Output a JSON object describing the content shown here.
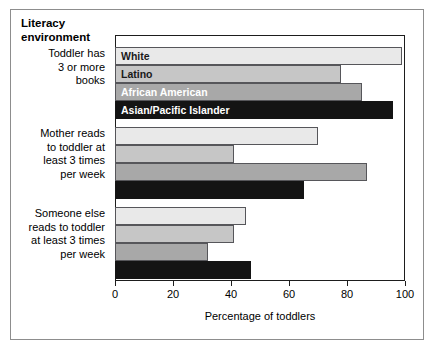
{
  "figure": {
    "heading": "Literacy environment",
    "xlabel": "Percentage of toddlers",
    "colors": {
      "white_series": "#e9e9e9",
      "latino_series": "#c6c6c6",
      "african_american_series": "#a8a8a8",
      "asian_pacific_islander_series": "#141414",
      "frame": "#1d1d1d",
      "background": "#ffffff"
    }
  },
  "chart_data": {
    "type": "bar",
    "orientation": "horizontal",
    "title": "Literacy environment",
    "xlabel": "Percentage of toddlers",
    "ylabel": "",
    "xlim": [
      0,
      100
    ],
    "xticks": [
      0,
      20,
      40,
      60,
      80,
      100
    ],
    "xticklabels": [
      "0",
      "20",
      "40",
      "60",
      "80",
      "100"
    ],
    "grid": false,
    "legend": "in-bar labels on first category group",
    "categories": [
      "Toddler has 3 or more books",
      "Mother reads to toddler at least 3 times per week",
      "Someone else reads to toddler at least 3 times per week"
    ],
    "category_lines": [
      [
        "Toddler has",
        "3 or more",
        "books"
      ],
      [
        "Mother reads",
        "to toddler at",
        "least 3 times",
        "per week"
      ],
      [
        "Someone else",
        "reads to toddler",
        "at least 3 times",
        "per week"
      ]
    ],
    "series": [
      {
        "name": "White",
        "values": [
          99,
          70,
          45
        ]
      },
      {
        "name": "Latino",
        "values": [
          78,
          41,
          41
        ]
      },
      {
        "name": "African American",
        "values": [
          85,
          87,
          32
        ]
      },
      {
        "name": "Asian/Pacific Islander",
        "values": [
          96,
          65,
          47
        ]
      }
    ]
  }
}
